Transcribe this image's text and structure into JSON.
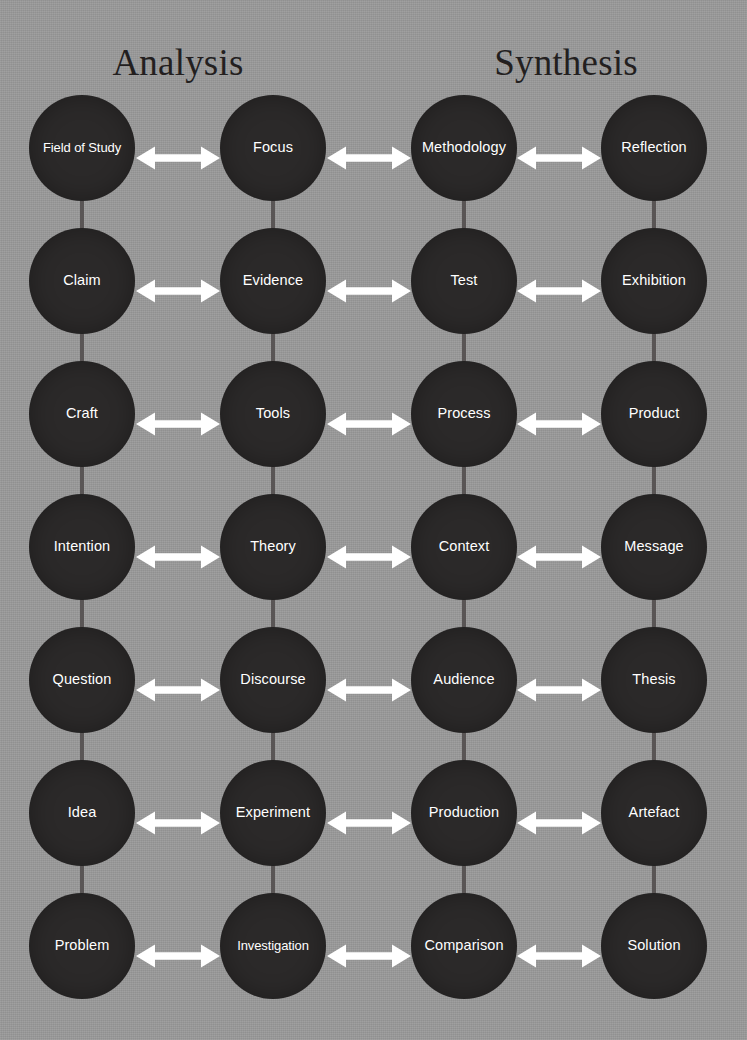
{
  "diagram": {
    "background_color": "#9a9a9a",
    "node_color": "#2b2929",
    "label_color": "#ffffff",
    "arrow_color": "#ffffff",
    "connector_color": "#595555",
    "header_color": "#231f1f"
  },
  "headers": [
    {
      "label": "Analysis",
      "center_x": 178
    },
    {
      "label": "Synthesis",
      "center_x": 566
    }
  ],
  "columns": [
    {
      "index": 0,
      "center_x": 82,
      "group": "Analysis"
    },
    {
      "index": 1,
      "center_x": 273,
      "group": "Analysis"
    },
    {
      "index": 2,
      "center_x": 464,
      "group": "Synthesis"
    },
    {
      "index": 3,
      "center_x": 654,
      "group": "Synthesis"
    }
  ],
  "rows": [
    {
      "index": 0,
      "center_y": 148
    },
    {
      "index": 1,
      "center_y": 281
    },
    {
      "index": 2,
      "center_y": 414
    },
    {
      "index": 3,
      "center_y": 547
    },
    {
      "index": 4,
      "center_y": 680
    },
    {
      "index": 5,
      "center_y": 813
    },
    {
      "index": 6,
      "center_y": 946
    }
  ],
  "nodes": [
    [
      "Field of Study",
      "Focus",
      "Methodology",
      "Reflection"
    ],
    [
      "Claim",
      "Evidence",
      "Test",
      "Exhibition"
    ],
    [
      "Craft",
      "Tools",
      "Process",
      "Product"
    ],
    [
      "Intention",
      "Theory",
      "Context",
      "Message"
    ],
    [
      "Question",
      "Discourse",
      "Audience",
      "Thesis"
    ],
    [
      "Idea",
      "Experiment",
      "Production",
      "Artefact"
    ],
    [
      "Problem",
      "Investigation",
      "Comparison",
      "Solution"
    ]
  ],
  "arrow_icon_name": "double-headed-arrow-icon",
  "connector_icon_name": "vertical-connector-line"
}
